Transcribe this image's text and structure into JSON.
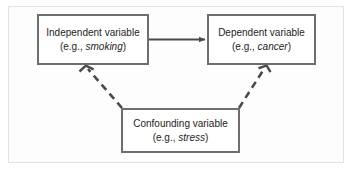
{
  "diagram": {
    "background_color": "#fdfdfd",
    "frame_color": "#e3e3e3",
    "box_border_color": "#6e6e6e",
    "arrow_color": "#4a4a4a",
    "nodes": [
      {
        "id": "independent",
        "title": "Independent variable",
        "example_prefix": "(e.g., ",
        "example_value": "smoking",
        "example_suffix": ")"
      },
      {
        "id": "dependent",
        "title": "Dependent variable",
        "example_prefix": "(e.g., ",
        "example_value": "cancer",
        "example_suffix": ")"
      },
      {
        "id": "confounding",
        "title": "Confounding variable",
        "example_prefix": "(e.g., ",
        "example_value": "stress",
        "example_suffix": ")"
      }
    ],
    "edges": [
      {
        "id": "independent-to-dependent",
        "from": "independent",
        "to": "dependent",
        "style": "solid",
        "arrowhead": "filled"
      },
      {
        "id": "confounding-to-independent",
        "from": "confounding",
        "to": "independent",
        "style": "dashed",
        "arrowhead": "open"
      },
      {
        "id": "confounding-to-dependent",
        "from": "confounding",
        "to": "dependent",
        "style": "dashed",
        "arrowhead": "open"
      }
    ]
  }
}
